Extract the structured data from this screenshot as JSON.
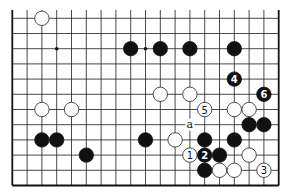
{
  "diagram": {
    "type": "go-board-fragment",
    "board_size": 19,
    "visible_columns": 19,
    "visible_rows": 12,
    "edges": {
      "left": true,
      "right": true,
      "bottom": true,
      "top": false
    },
    "star_points": [
      {
        "col": 3,
        "row": 2
      },
      {
        "col": 9,
        "row": 2
      }
    ],
    "stones": [
      {
        "color": "white",
        "col": 2,
        "row": 0,
        "label": ""
      },
      {
        "color": "black",
        "col": 8,
        "row": 2,
        "label": ""
      },
      {
        "color": "black",
        "col": 10,
        "row": 2,
        "label": ""
      },
      {
        "color": "black",
        "col": 12,
        "row": 2,
        "label": ""
      },
      {
        "color": "black",
        "col": 15,
        "row": 2,
        "label": ""
      },
      {
        "color": "black",
        "col": 15,
        "row": 4,
        "label": "4"
      },
      {
        "color": "white",
        "col": 10,
        "row": 5,
        "label": ""
      },
      {
        "color": "white",
        "col": 12,
        "row": 5,
        "label": ""
      },
      {
        "color": "black",
        "col": 17,
        "row": 5,
        "label": "6"
      },
      {
        "color": "white",
        "col": 2,
        "row": 6,
        "label": ""
      },
      {
        "color": "white",
        "col": 4,
        "row": 6,
        "label": ""
      },
      {
        "color": "white",
        "col": 13,
        "row": 6,
        "label": "5"
      },
      {
        "color": "white",
        "col": 15,
        "row": 6,
        "label": ""
      },
      {
        "color": "white",
        "col": 16,
        "row": 6,
        "label": ""
      },
      {
        "color": "black",
        "col": 16,
        "row": 7,
        "label": ""
      },
      {
        "color": "black",
        "col": 17,
        "row": 7,
        "label": ""
      },
      {
        "color": "black",
        "col": 2,
        "row": 8,
        "label": ""
      },
      {
        "color": "black",
        "col": 3,
        "row": 8,
        "label": ""
      },
      {
        "color": "black",
        "col": 9,
        "row": 8,
        "label": ""
      },
      {
        "color": "white",
        "col": 11,
        "row": 8,
        "label": ""
      },
      {
        "color": "black",
        "col": 13,
        "row": 8,
        "label": ""
      },
      {
        "color": "black",
        "col": 15,
        "row": 8,
        "label": ""
      },
      {
        "color": "black",
        "col": 5,
        "row": 9,
        "label": ""
      },
      {
        "color": "white",
        "col": 12,
        "row": 9,
        "label": "1"
      },
      {
        "color": "black",
        "col": 13,
        "row": 9,
        "label": "2"
      },
      {
        "color": "black",
        "col": 14,
        "row": 9,
        "label": ""
      },
      {
        "color": "white",
        "col": 16,
        "row": 9,
        "label": ""
      },
      {
        "color": "black",
        "col": 13,
        "row": 10,
        "label": ""
      },
      {
        "color": "white",
        "col": 14,
        "row": 10,
        "label": ""
      },
      {
        "color": "white",
        "col": 15,
        "row": 10,
        "label": ""
      },
      {
        "color": "white",
        "col": 17,
        "row": 10,
        "label": "3"
      }
    ],
    "marks": [
      {
        "col": 12,
        "row": 7,
        "text": "a"
      }
    ]
  }
}
